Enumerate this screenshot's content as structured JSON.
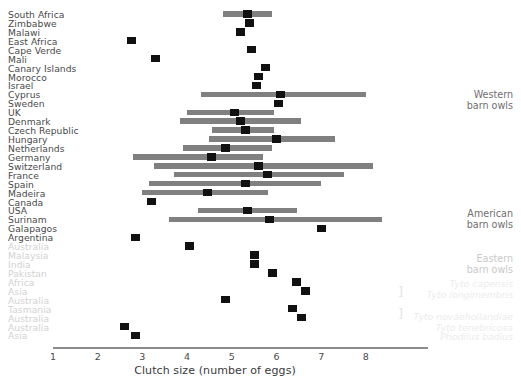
{
  "chart_data": {
    "type": "bar",
    "title": "",
    "xlabel": "Clutch size (number of eggs)",
    "ylabel": "",
    "xlim": [
      1,
      8.4
    ],
    "xticks": [
      1,
      2,
      3,
      4,
      5,
      6,
      7,
      8
    ],
    "grid": false,
    "legend": "none",
    "note": "Horizontal range bars with a dark square point estimate (mean clutch size) per population; rows without a bar show only the point estimate.",
    "categories": [
      "South Africa",
      "Zimbabwe",
      "Malawi",
      "East Africa",
      "Cape Verde",
      "Mali",
      "Canary Islands",
      "Morocco",
      "Israel",
      "Cyprus",
      "Sweden",
      "UK",
      "Denmark",
      "Czech Republic",
      "Hungary",
      "Netherlands",
      "Germany",
      "Switzerland",
      "France",
      "Spain",
      "Madeira",
      "Canada",
      "USA",
      "Surinam",
      "Galapagos",
      "Argentina",
      "Australia",
      "Malaysia",
      "India",
      "Pakistan",
      "Africa",
      "Asia",
      "Australia",
      "Tasmania",
      "Australia",
      "Australia",
      "Asia"
    ],
    "rows": [
      {
        "label": "South Africa",
        "faded": false,
        "point": 5.35,
        "range": [
          4.8,
          5.9
        ]
      },
      {
        "label": "Zimbabwe",
        "faded": false,
        "point": 5.4,
        "range": null
      },
      {
        "label": "Malawi",
        "faded": false,
        "point": 5.2,
        "range": null
      },
      {
        "label": "East Africa",
        "faded": false,
        "point": 2.75,
        "range": null
      },
      {
        "label": "Cape Verde",
        "faded": false,
        "point": 5.45,
        "range": null
      },
      {
        "label": "Mali",
        "faded": false,
        "point": 3.3,
        "range": null
      },
      {
        "label": "Canary Islands",
        "faded": false,
        "point": 5.75,
        "range": null
      },
      {
        "label": "Morocco",
        "faded": false,
        "point": 5.6,
        "range": null
      },
      {
        "label": "Israel",
        "faded": false,
        "point": 5.55,
        "range": null
      },
      {
        "label": "Cyprus",
        "faded": false,
        "point": 6.1,
        "range": [
          4.3,
          8.0
        ]
      },
      {
        "label": "Sweden",
        "faded": false,
        "point": 6.05,
        "range": null
      },
      {
        "label": "UK",
        "faded": false,
        "point": 5.05,
        "range": [
          4.0,
          5.95
        ]
      },
      {
        "label": "Denmark",
        "faded": false,
        "point": 5.2,
        "range": [
          3.85,
          6.55
        ]
      },
      {
        "label": "Czech Republic",
        "faded": false,
        "point": 5.3,
        "range": [
          4.55,
          5.95
        ]
      },
      {
        "label": "Hungary",
        "faded": false,
        "point": 6.0,
        "range": [
          4.5,
          7.3
        ]
      },
      {
        "label": "Netherlands",
        "faded": false,
        "point": 4.85,
        "range": [
          3.9,
          5.9
        ]
      },
      {
        "label": "Germany",
        "faded": false,
        "point": 4.55,
        "range": [
          2.8,
          5.7
        ]
      },
      {
        "label": "Switzerland",
        "faded": false,
        "point": 5.6,
        "range": [
          3.25,
          8.15
        ]
      },
      {
        "label": "France",
        "faded": false,
        "point": 5.8,
        "range": [
          3.7,
          7.5
        ]
      },
      {
        "label": "Spain",
        "faded": false,
        "point": 5.3,
        "range": [
          3.15,
          7.0
        ]
      },
      {
        "label": "Madeira",
        "faded": false,
        "point": 4.45,
        "range": [
          3.0,
          5.8
        ]
      },
      {
        "label": "Canada",
        "faded": false,
        "point": 3.2,
        "range": null
      },
      {
        "label": "USA",
        "faded": false,
        "point": 5.35,
        "range": [
          4.25,
          6.45
        ]
      },
      {
        "label": "Surinam",
        "faded": false,
        "point": 5.85,
        "range": [
          3.6,
          8.35
        ]
      },
      {
        "label": "Galapagos",
        "faded": false,
        "point": 7.0,
        "range": null
      },
      {
        "label": "Argentina",
        "faded": false,
        "point": 2.85,
        "range": null
      },
      {
        "label": "Australia",
        "faded": true,
        "point": 4.05,
        "range": null
      },
      {
        "label": "Malaysia",
        "faded": true,
        "point": 5.5,
        "range": null
      },
      {
        "label": "India",
        "faded": true,
        "point": 5.5,
        "range": null
      },
      {
        "label": "Pakistan",
        "faded": true,
        "point": 5.9,
        "range": null
      },
      {
        "label": "Africa",
        "faded": true,
        "point": 6.45,
        "range": null
      },
      {
        "label": "Asia",
        "faded": true,
        "point": 6.65,
        "range": null
      },
      {
        "label": "Australia",
        "faded": true,
        "point": 4.85,
        "range": null
      },
      {
        "label": "Tasmania",
        "faded": true,
        "point": 6.35,
        "range": null
      },
      {
        "label": "Australia",
        "faded": true,
        "point": 6.55,
        "range": null
      },
      {
        "label": "Australia",
        "faded": true,
        "point": 2.6,
        "range": null
      },
      {
        "label": "Asia",
        "faded": true,
        "point": 2.85,
        "range": null
      }
    ],
    "group_annotations": [
      {
        "name": "western-barn-owls",
        "lines": [
          "Western",
          "barn owls"
        ],
        "style": "strong",
        "bracket": false
      },
      {
        "name": "american-barn-owls",
        "lines": [
          "American",
          "barn owls"
        ],
        "style": "strong",
        "bracket": false
      },
      {
        "name": "eastern-barn-owls",
        "lines": [
          "Eastern",
          "barn owls"
        ],
        "style": "mid",
        "bracket": false
      },
      {
        "name": "tyto-capensis",
        "lines": [
          "Tyto capensis"
        ],
        "style": "species",
        "bracket": false
      },
      {
        "name": "tyto-longimembris",
        "lines": [
          "Tyto longimembris"
        ],
        "style": "species",
        "bracket": true
      },
      {
        "name": "tyto-novaehollandiae",
        "lines": [
          "Tyto novaehollandiae"
        ],
        "style": "species",
        "bracket": true
      },
      {
        "name": "tyto-tenebricosa",
        "lines": [
          "Tyto tenebricosa"
        ],
        "style": "species",
        "bracket": false
      },
      {
        "name": "phodilus-badius",
        "lines": [
          "Phodilus badius"
        ],
        "style": "species",
        "bracket": false
      }
    ],
    "colors": {
      "bar": "#808080",
      "marker": "#111111",
      "label": "#4a4a4a",
      "label_faded": "#d2d2d2",
      "axis": "#8c8c8c"
    }
  },
  "axis": {
    "title": "Clutch size (number of eggs)",
    "ticks": [
      "1",
      "2",
      "3",
      "4",
      "5",
      "6",
      "7",
      "8"
    ]
  },
  "annotations": {
    "western": {
      "l1": "Western",
      "l2": "barn owls"
    },
    "american": {
      "l1": "American",
      "l2": "barn owls"
    },
    "eastern": {
      "l1": "Eastern",
      "l2": "barn owls"
    },
    "sp1": "Tyto capensis",
    "sp2": "Tyto longimembris",
    "sp3": "Tyto novaehollandiae",
    "sp4": "Tyto tenebricosa",
    "sp5": "Phodilus badius",
    "bracket_glyph": "]"
  }
}
